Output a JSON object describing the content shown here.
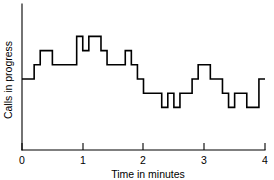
{
  "chart_data": {
    "type": "line",
    "subtype": "step-post",
    "title": "",
    "xlabel": "Time in minutes",
    "ylabel": "Calls in progress",
    "xlim": [
      0,
      4
    ],
    "ylim": [
      0,
      10
    ],
    "xticks": [
      0,
      1,
      2,
      3,
      4
    ],
    "xtick_labels": [
      "0",
      "1",
      "2",
      "3",
      "4"
    ],
    "yticks": [],
    "ytick_labels": [],
    "grid": false,
    "legend": false,
    "legend_position": "none",
    "line_color": "#000000",
    "background_color": "#ffffff",
    "series": [
      {
        "name": "Calls in progress",
        "x": [
          0.0,
          0.1,
          0.2,
          0.3,
          0.4,
          0.5,
          0.6,
          0.7,
          0.8,
          0.9,
          1.0,
          1.1,
          1.2,
          1.3,
          1.4,
          1.5,
          1.6,
          1.7,
          1.8,
          1.9,
          2.0,
          2.1,
          2.2,
          2.3,
          2.4,
          2.5,
          2.6,
          2.7,
          2.8,
          2.9,
          3.0,
          3.1,
          3.2,
          3.3,
          3.4,
          3.5,
          3.6,
          3.7,
          3.8,
          3.9,
          4.0
        ],
        "values": [
          5,
          5,
          6,
          7,
          7,
          6,
          6,
          6,
          6,
          8,
          7,
          8,
          8,
          7,
          6,
          6,
          6,
          7,
          6,
          5,
          4,
          4,
          4,
          3,
          4,
          3,
          4,
          4,
          5,
          6,
          6,
          5,
          5,
          4,
          3,
          4,
          4,
          3,
          3,
          5,
          5
        ]
      }
    ],
    "annotations": []
  },
  "axes": {
    "x_axis_name": "x-axis",
    "y_axis_name": "y-axis",
    "x_title": "Time in minutes",
    "y_title": "Calls in progress"
  }
}
